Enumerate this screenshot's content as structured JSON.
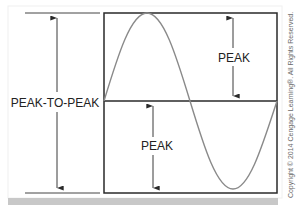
{
  "diagram": {
    "labels": {
      "peak_to_peak": "PEAK-TO-PEAK",
      "peak_upper": "PEAK",
      "peak_lower": "PEAK"
    },
    "copyright": "Copyright © 2014 Cengage Learning®. All Rights Reserved.",
    "colors": {
      "frame": "#2a2a2a",
      "wave": "#8a8a8a",
      "arrow": "#3a3a3a",
      "text": "#222222",
      "footer_bar": "#c8c8c8",
      "copyright_text": "#6a6a6a"
    }
  }
}
